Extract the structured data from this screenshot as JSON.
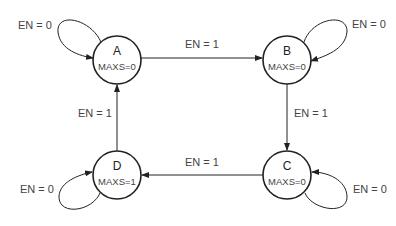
{
  "diagram": {
    "type": "state-machine",
    "states": [
      {
        "id": "A",
        "name": "A",
        "output": "MAXS=0",
        "cx": 117,
        "cy": 60
      },
      {
        "id": "B",
        "name": "B",
        "output": "MAXS=0",
        "cx": 287,
        "cy": 60
      },
      {
        "id": "C",
        "name": "C",
        "output": "MAXS=0",
        "cx": 287,
        "cy": 175
      },
      {
        "id": "D",
        "name": "D",
        "output": "MAXS=1",
        "cx": 117,
        "cy": 175
      }
    ],
    "transitions": [
      {
        "from": "A",
        "to": "A",
        "label": "EN = 0"
      },
      {
        "from": "A",
        "to": "B",
        "label": "EN = 1"
      },
      {
        "from": "B",
        "to": "B",
        "label": "EN = 0"
      },
      {
        "from": "B",
        "to": "C",
        "label": "EN = 1"
      },
      {
        "from": "C",
        "to": "C",
        "label": "EN = 0"
      },
      {
        "from": "C",
        "to": "D",
        "label": "EN = 1"
      },
      {
        "from": "D",
        "to": "D",
        "label": "EN = 0"
      },
      {
        "from": "D",
        "to": "A",
        "label": "EN = 1"
      }
    ],
    "colors": {
      "stroke": "#222222",
      "text": "#444444",
      "background": "#ffffff"
    }
  }
}
